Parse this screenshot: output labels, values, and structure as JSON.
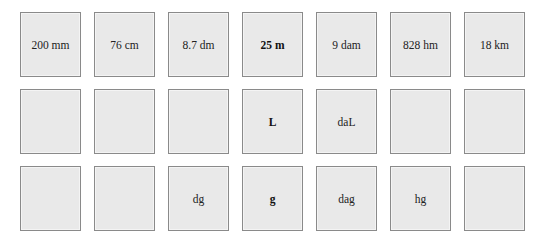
{
  "grid": {
    "rows": [
      {
        "name": "length",
        "cells": [
          {
            "label": "200 mm",
            "bold": false
          },
          {
            "label": "76 cm",
            "bold": false
          },
          {
            "label": "8.7 dm",
            "bold": false
          },
          {
            "label": "25 m",
            "bold": true
          },
          {
            "label": "9 dam",
            "bold": false
          },
          {
            "label": "828 hm",
            "bold": false
          },
          {
            "label": "18 km",
            "bold": false
          }
        ]
      },
      {
        "name": "volume",
        "cells": [
          {
            "label": "",
            "bold": false
          },
          {
            "label": "",
            "bold": false
          },
          {
            "label": "",
            "bold": false
          },
          {
            "label": "L",
            "bold": true
          },
          {
            "label": "daL",
            "bold": false
          },
          {
            "label": "",
            "bold": false
          },
          {
            "label": "",
            "bold": false
          }
        ]
      },
      {
        "name": "mass",
        "cells": [
          {
            "label": "",
            "bold": false
          },
          {
            "label": "",
            "bold": false
          },
          {
            "label": "dg",
            "bold": false
          },
          {
            "label": "g",
            "bold": true
          },
          {
            "label": "dag",
            "bold": false
          },
          {
            "label": "hg",
            "bold": false
          },
          {
            "label": "",
            "bold": false
          }
        ]
      }
    ]
  },
  "colors": {
    "box_fill": "#e9e9e9",
    "box_border": "#8a8a8a",
    "text": "#222222",
    "background": "#ffffff"
  }
}
